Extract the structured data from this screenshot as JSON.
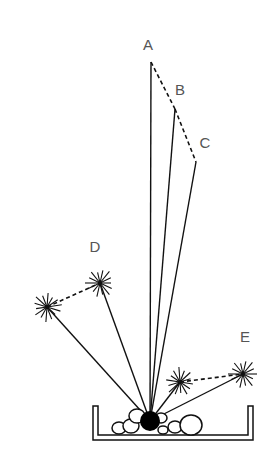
{
  "diagram": {
    "title": "",
    "labels": [
      {
        "id": "A",
        "text": "A",
        "x": 148,
        "y": 50
      },
      {
        "id": "B",
        "text": "B",
        "x": 180,
        "y": 95
      },
      {
        "id": "C",
        "text": "C",
        "x": 205,
        "y": 148
      },
      {
        "id": "D",
        "text": "D",
        "x": 95,
        "y": 252
      },
      {
        "id": "E",
        "text": "E",
        "x": 245,
        "y": 342
      }
    ],
    "origin": {
      "x": 150,
      "y": 421,
      "r": 10
    },
    "rays": [
      {
        "to": "A",
        "x": 151,
        "y": 62
      },
      {
        "to": "B",
        "x": 175,
        "y": 109
      },
      {
        "to": "C",
        "x": 196,
        "y": 162
      },
      {
        "to": "D-burst",
        "x": 100,
        "y": 283
      },
      {
        "to": "D-left-burst",
        "x": 47,
        "y": 307
      },
      {
        "to": "E-inner-burst",
        "x": 180,
        "y": 382
      },
      {
        "to": "E-burst",
        "x": 243,
        "y": 374
      }
    ],
    "dashed_links": [
      {
        "from": "A",
        "to": "B"
      },
      {
        "from": "B",
        "to": "C"
      },
      {
        "from": "D-left-burst",
        "to": "D-burst"
      },
      {
        "from": "E-inner-burst",
        "to": "E-burst"
      }
    ],
    "bursts": [
      {
        "id": "D-burst",
        "x": 100,
        "y": 283
      },
      {
        "id": "D-left-burst",
        "x": 47,
        "y": 307
      },
      {
        "id": "E-inner-burst",
        "x": 180,
        "y": 382
      },
      {
        "id": "E-burst",
        "x": 243,
        "y": 374
      }
    ],
    "pebbles": [
      {
        "x": 119,
        "y": 428,
        "r": 6
      },
      {
        "x": 131,
        "y": 426,
        "r": 7
      },
      {
        "x": 137,
        "y": 416,
        "r": 7
      },
      {
        "x": 161,
        "y": 418,
        "r": 5
      },
      {
        "x": 163,
        "y": 430,
        "r": 4
      },
      {
        "x": 175,
        "y": 427,
        "r": 6
      },
      {
        "x": 191,
        "y": 425,
        "r": 10
      }
    ],
    "tray": {
      "left": 93,
      "right": 253,
      "top": 406,
      "bottom": 440,
      "inset": 5
    }
  }
}
